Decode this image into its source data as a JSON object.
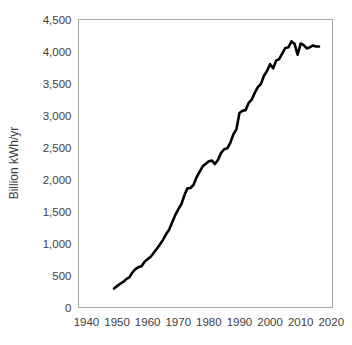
{
  "chart_data": {
    "type": "line",
    "title": "",
    "xlabel": "",
    "ylabel": "Billion kWh/yr",
    "xlim": [
      1937.4,
      2020.4
    ],
    "ylim": [
      0,
      4500
    ],
    "grid": false,
    "legend": "none",
    "x_ticks": [
      "1940",
      "1950",
      "1960",
      "1970",
      "1980",
      "1990",
      "2000",
      "2010",
      "2020"
    ],
    "x_tick_values": [
      1940,
      1950,
      1960,
      1970,
      1980,
      1990,
      2000,
      2010,
      2020
    ],
    "y_ticks": [
      "0",
      "500",
      "1,000",
      "1,500",
      "2,000",
      "2,500",
      "3,000",
      "3,500",
      "4,000",
      "4,500"
    ],
    "y_tick_values": [
      0,
      500,
      1000,
      1500,
      2000,
      2500,
      3000,
      3500,
      4000,
      4500
    ],
    "series": [
      {
        "name": "Electricity generation",
        "color": "#000000",
        "x": [
          1949,
          1950,
          1951,
          1952,
          1953,
          1954,
          1955,
          1956,
          1957,
          1958,
          1959,
          1960,
          1961,
          1962,
          1963,
          1964,
          1965,
          1966,
          1967,
          1968,
          1969,
          1970,
          1971,
          1972,
          1973,
          1974,
          1975,
          1976,
          1977,
          1978,
          1979,
          1980,
          1981,
          1982,
          1983,
          1984,
          1985,
          1986,
          1987,
          1988,
          1989,
          1990,
          1991,
          1992,
          1993,
          1994,
          1995,
          1996,
          1997,
          1998,
          1999,
          2000,
          2001,
          2002,
          2003,
          2004,
          2005,
          2006,
          2007,
          2008,
          2009,
          2010,
          2011,
          2012,
          2013,
          2014,
          2015,
          2016
        ],
        "values": [
          296,
          334,
          371,
          399,
          443,
          471,
          547,
          601,
          632,
          645,
          714,
          756,
          794,
          855,
          918,
          984,
          1055,
          1144,
          1214,
          1329,
          1442,
          1532,
          1613,
          1753,
          1861,
          1867,
          1918,
          2038,
          2124,
          2206,
          2247,
          2286,
          2295,
          2241,
          2310,
          2416,
          2473,
          2487,
          2572,
          2704,
          2784,
          3038,
          3074,
          3084,
          3197,
          3248,
          3353,
          3444,
          3492,
          3620,
          3695,
          3802,
          3737,
          3858,
          3883,
          3971,
          4055,
          4065,
          4157,
          4119,
          3950,
          4125,
          4100,
          4048,
          4066,
          4094,
          4078,
          4077
        ]
      }
    ]
  },
  "axes": {
    "y_title": "Billion kWh/yr"
  }
}
